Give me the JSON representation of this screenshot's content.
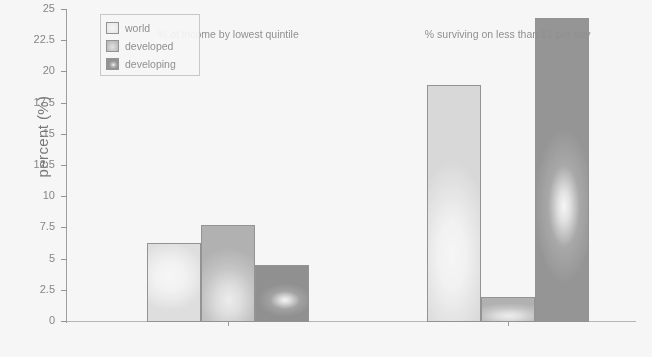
{
  "chart_data": {
    "type": "bar",
    "title": "",
    "xlabel": "",
    "ylabel": "percent (%)",
    "ylim": [
      0,
      25
    ],
    "yticks": [
      "0",
      "2.5",
      "5",
      "7.5",
      "10",
      "12.5",
      "15",
      "17.5",
      "20",
      "22.5",
      "25"
    ],
    "grid": false,
    "legend_position": "upper left",
    "categories": [
      "% of income by lowest quintile",
      "% surviving on less than $1 per day"
    ],
    "series": [
      {
        "name": "world",
        "values": [
          6.3,
          19.0
        ]
      },
      {
        "name": "developed",
        "values": [
          7.8,
          2.0
        ]
      },
      {
        "name": "developing",
        "values": [
          4.6,
          24.4
        ]
      }
    ]
  },
  "legend": {
    "items": [
      {
        "label": "world",
        "key": "world"
      },
      {
        "label": "developed",
        "key": "developed"
      },
      {
        "label": "developing",
        "key": "developing"
      }
    ]
  },
  "corner": {
    "mark": "᠎"
  }
}
